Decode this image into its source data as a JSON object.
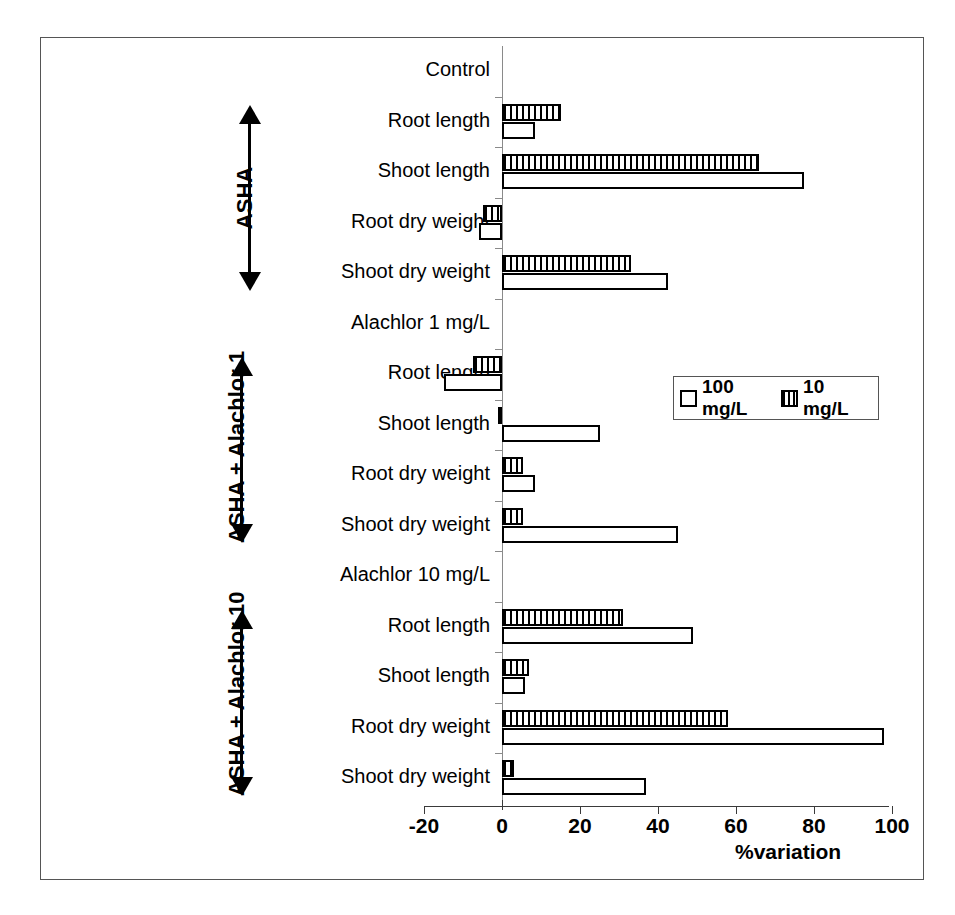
{
  "chart_data": {
    "type": "bar",
    "orientation": "horizontal",
    "title": "",
    "xlabel": "%variation",
    "ylabel": "",
    "xlim": [
      -20,
      100
    ],
    "xticks": [
      -20,
      0,
      20,
      40,
      60,
      80,
      100
    ],
    "xticklabels": [
      "-20",
      "0",
      "20",
      "40",
      "60",
      "80",
      "100"
    ],
    "grid": false,
    "legend_position": "center-right",
    "legend": [
      "100 mg/L",
      "10 mg/L"
    ],
    "series": [
      {
        "name": "100 mg/L",
        "style": "open",
        "values": [
          null,
          8.5,
          77.5,
          -6.0,
          42.5,
          null,
          -15.0,
          25.0,
          8.5,
          45.0,
          null,
          49.0,
          6.0,
          98.0,
          37.0
        ]
      },
      {
        "name": "10 mg/L",
        "style": "hatched",
        "values": [
          null,
          15.0,
          66.0,
          -5.0,
          33.0,
          null,
          -7.5,
          -1.0,
          5.5,
          5.5,
          null,
          31.0,
          7.0,
          58.0,
          3.0
        ]
      }
    ],
    "categories": [
      "Control",
      "Root length",
      "Shoot length",
      "Root dry weight",
      "Shoot dry weight",
      "Alachlor 1 mg/L",
      "Root length",
      "Shoot length",
      "Root dry weight",
      "Shoot dry weight",
      "Alachlor 10 mg/L",
      "Root length",
      "Shoot length",
      "Root dry weight",
      "Shoot dry weight"
    ],
    "group_labels": [
      "ASHA",
      "ASHA + Alachlor 1",
      "ASHA + Alachlor 10"
    ],
    "section_headers": [
      "Control",
      "Alachlor 1 mg/L",
      "Alachlor 10 mg/L"
    ]
  },
  "axis": {
    "xlabel": "%variation",
    "ticks": [
      {
        "label": "-20",
        "value": -20
      },
      {
        "label": "0",
        "value": 0
      },
      {
        "label": "20",
        "value": 20
      },
      {
        "label": "40",
        "value": 40
      },
      {
        "label": "60",
        "value": 60
      },
      {
        "label": "80",
        "value": 80
      },
      {
        "label": "100",
        "value": 100
      }
    ]
  },
  "categories": [
    {
      "label": "Control",
      "kind": "header"
    },
    {
      "label": "Root length",
      "kind": "item"
    },
    {
      "label": "Shoot length",
      "kind": "item"
    },
    {
      "label": "Root dry weight",
      "kind": "item"
    },
    {
      "label": "Shoot dry weight",
      "kind": "item"
    },
    {
      "label": "Alachlor 1 mg/L",
      "kind": "header"
    },
    {
      "label": "Root length",
      "kind": "item"
    },
    {
      "label": "Shoot length",
      "kind": "item"
    },
    {
      "label": "Root dry weight",
      "kind": "item"
    },
    {
      "label": "Shoot dry weight",
      "kind": "item"
    },
    {
      "label": "Alachlor 10 mg/L",
      "kind": "header"
    },
    {
      "label": "Root length",
      "kind": "item"
    },
    {
      "label": "Shoot length",
      "kind": "item"
    },
    {
      "label": "Root dry weight",
      "kind": "item"
    },
    {
      "label": "Shoot dry weight",
      "kind": "item"
    }
  ],
  "groups": [
    {
      "label": "ASHA"
    },
    {
      "label": "ASHA + Alachlor 1"
    },
    {
      "label": "ASHA + Alachlor 10"
    }
  ],
  "legend": {
    "items": [
      {
        "label": "100 mg/L",
        "style": "open"
      },
      {
        "label": "10 mg/L",
        "style": "hatched"
      }
    ]
  },
  "colors": {
    "bar_outline": "#000000",
    "bar_fill_open": "#ffffff",
    "bar_fill_hatched": "#000000",
    "axis": "#3a3a3a",
    "frame": "#555555"
  }
}
